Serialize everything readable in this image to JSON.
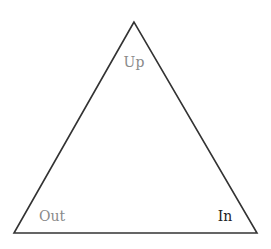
{
  "diagram": {
    "shape": "triangle",
    "vertices": [
      {
        "id": "top",
        "label": "Up",
        "color": "#8a8a8a"
      },
      {
        "id": "bottom-left",
        "label": "Out",
        "color": "#8a8a8a"
      },
      {
        "id": "bottom-right",
        "label": "In",
        "color": "#222222"
      }
    ],
    "stroke_color": "#333333"
  }
}
